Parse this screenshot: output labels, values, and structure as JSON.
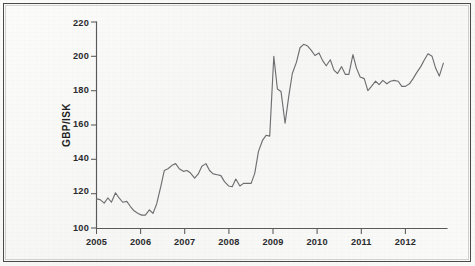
{
  "figure": {
    "background_color": "#f7f7f6",
    "frame_color": "#4a4a4a",
    "line_color": "#6f6f72",
    "axis_color": "#59595a"
  },
  "chart_data": {
    "type": "line",
    "title": "",
    "subtitle": "",
    "xlabel": "",
    "ylabel": "GBP/ISK",
    "xlim": [
      2005.0,
      2012.75
    ],
    "ylim": [
      100,
      220
    ],
    "grid": false,
    "legend": null,
    "y_ticks": [
      100,
      120,
      140,
      160,
      180,
      200,
      220
    ],
    "y_tick_labels": [
      "100",
      "120",
      "140",
      "160",
      "180",
      "200",
      "220"
    ],
    "x_ticks": [
      2005,
      2006,
      2007,
      2008,
      2009,
      2010,
      2011,
      2012
    ],
    "x_tick_labels": [
      "2005",
      "2006",
      "2007",
      "2008",
      "2009",
      "2010",
      "2011",
      "2012"
    ],
    "series": [
      {
        "name": "GBP/ISK",
        "color": "#6f6f72",
        "x": [
          2005.0,
          2005.08,
          2005.17,
          2005.25,
          2005.33,
          2005.42,
          2005.5,
          2005.58,
          2005.67,
          2005.75,
          2005.83,
          2005.92,
          2006.0,
          2006.08,
          2006.17,
          2006.25,
          2006.33,
          2006.42,
          2006.5,
          2006.58,
          2006.67,
          2006.75,
          2006.83,
          2006.92,
          2007.0,
          2007.08,
          2007.17,
          2007.25,
          2007.33,
          2007.42,
          2007.5,
          2007.58,
          2007.67,
          2007.75,
          2007.83,
          2007.92,
          2008.0,
          2008.08,
          2008.17,
          2008.25,
          2008.33,
          2008.42,
          2008.5,
          2008.58,
          2008.67,
          2008.75,
          2008.83,
          2008.92,
          2009.0,
          2009.08,
          2009.17,
          2009.25,
          2009.33,
          2009.42,
          2009.5,
          2009.58,
          2009.67,
          2009.75,
          2009.83,
          2009.92,
          2010.0,
          2010.08,
          2010.17,
          2010.25,
          2010.33,
          2010.42,
          2010.5,
          2010.58,
          2010.67,
          2010.75,
          2010.83,
          2010.92,
          2011.0,
          2011.08,
          2011.17,
          2011.25,
          2011.33,
          2011.42,
          2011.5,
          2011.58,
          2011.67,
          2011.75,
          2011.83,
          2011.92,
          2012.0,
          2012.08,
          2012.17,
          2012.25,
          2012.33,
          2012.42,
          2012.5,
          2012.58,
          2012.67
        ],
        "y": [
          117.0,
          116.5,
          114.5,
          117.5,
          115.0,
          120.5,
          117.5,
          115.0,
          115.5,
          112.5,
          110.0,
          108.5,
          107.5,
          107.5,
          110.5,
          108.5,
          114.0,
          124.0,
          133.5,
          134.5,
          136.5,
          137.5,
          134.5,
          133.0,
          133.5,
          132.0,
          129.0,
          131.5,
          136.0,
          137.5,
          133.5,
          131.5,
          131.0,
          130.5,
          127.0,
          124.5,
          124.0,
          128.5,
          124.5,
          126.0,
          126.0,
          126.0,
          132.0,
          144.5,
          151.0,
          154.0,
          153.5,
          200.0,
          181.0,
          179.5,
          161.0,
          176.5,
          190.0,
          196.5,
          205.0,
          207.0,
          206.0,
          203.5,
          200.5,
          202.0,
          197.5,
          194.5,
          198.0,
          192.0,
          190.0,
          194.0,
          189.5,
          189.5,
          201.0,
          193.0,
          188.0,
          187.0,
          180.0,
          182.5,
          185.5,
          183.5,
          186.0,
          184.0,
          185.5,
          186.0,
          185.5,
          182.5,
          182.5,
          184.0,
          187.0,
          190.5,
          194.0,
          198.0,
          201.5,
          200.0,
          193.0,
          188.5,
          196.0
        ]
      }
    ]
  },
  "annotations": {
    "peak_2008_late": 200,
    "trough_2009_early": 161,
    "peak_2009_mid": 207,
    "min_2005_late": 107.5,
    "final_value": 196
  }
}
